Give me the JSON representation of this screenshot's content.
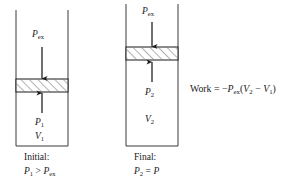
{
  "figure": {
    "background_color": "#ffffff",
    "line_color": "#3a3a3a",
    "piston_fill_color": "#ffffff",
    "hatch_color": "#555555",
    "text_color": "#1a1a1a"
  },
  "panels": [
    {
      "id": "initial",
      "cylinder": {
        "x": 16,
        "y": 10,
        "width": 52,
        "height": 136
      },
      "piston": {
        "x": 16,
        "y": 79,
        "width": 52,
        "height": 13
      },
      "external_pressure_label": "P",
      "external_pressure_sub": "ex",
      "gas_pressure_label": "P",
      "gas_pressure_sub": "1",
      "volume_label": "V",
      "volume_sub": "1",
      "caption_line1": "Initial:",
      "caption_line2_lhs": "P",
      "caption_line2_lhs_sub": "1",
      "caption_line2_operator": ">",
      "caption_line2_rhs": "P",
      "caption_line2_rhs_sub": "ex",
      "down_arrow": {
        "x": 42,
        "y_start": 47,
        "y_end": 79
      },
      "up_arrow": {
        "x": 42,
        "y_start": 113,
        "y_end": 93
      }
    },
    {
      "id": "final",
      "cylinder": {
        "x": 126,
        "y": 4,
        "width": 52,
        "height": 142
      },
      "piston": {
        "x": 126,
        "y": 47,
        "width": 52,
        "height": 13
      },
      "external_pressure_label": "P",
      "external_pressure_sub": "ex",
      "gas_pressure_label": "P",
      "gas_pressure_sub": "2",
      "volume_label": "V",
      "volume_sub": "2",
      "caption_line1": "Final:",
      "caption_line2_lhs": "P",
      "caption_line2_lhs_sub": "2",
      "caption_line2_operator": "=",
      "caption_line2_rhs": "P",
      "caption_line2_rhs_sub": "ex",
      "down_arrow": {
        "x": 152,
        "y_start": 22,
        "y_end": 47
      },
      "up_arrow": {
        "x": 152,
        "y_start": 82,
        "y_end": 62
      }
    }
  ],
  "equation": {
    "work_word": "Work",
    "equals": "=",
    "minus": "−",
    "pressure_symbol": "P",
    "pressure_sub": "ex",
    "open_paren": "(",
    "v_final_symbol": "V",
    "v_final_sub": "2",
    "subtract": "−",
    "v_initial_symbol": "V",
    "v_initial_sub": "1",
    "close_paren": ")",
    "full_text": "Work = −Pex(V2 − V1)"
  }
}
